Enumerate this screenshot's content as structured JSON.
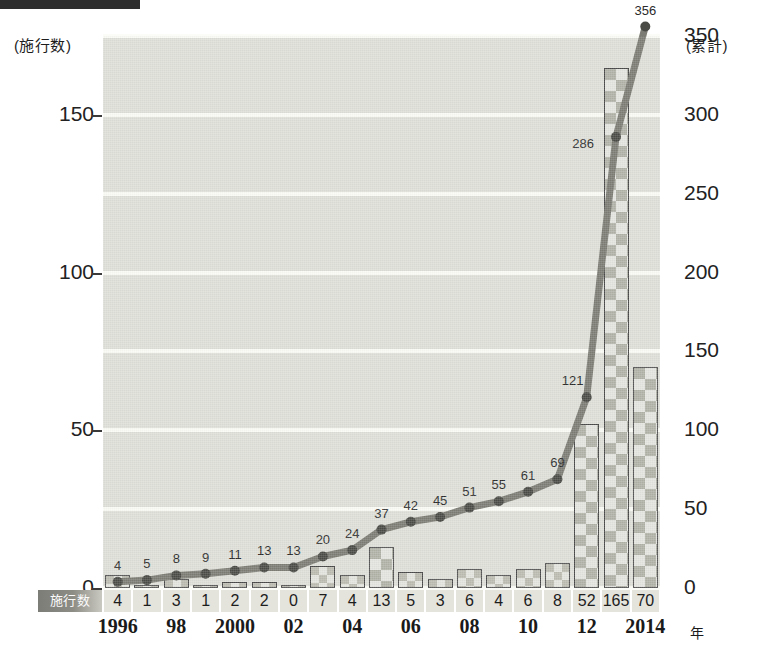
{
  "axis": {
    "left_caption": "(施行数)",
    "right_caption": "(累計)",
    "left_ticks": [
      "0",
      "50",
      "100",
      "150"
    ],
    "right_ticks": [
      "0",
      "50",
      "100",
      "150",
      "200",
      "250",
      "300",
      "350"
    ],
    "x_unit": "年",
    "row_label": "施行数"
  },
  "chart_data": {
    "type": "bar",
    "title": "",
    "subtitle": "",
    "xlabel": "年",
    "ylabel": "施行数",
    "grid": true,
    "legend_position": "none",
    "categories": [
      "1996",
      "1997",
      "1998",
      "1999",
      "2000",
      "2001",
      "2002",
      "2003",
      "2004",
      "2005",
      "2006",
      "2007",
      "2008",
      "2009",
      "2010",
      "2011",
      "2012",
      "2013",
      "2014"
    ],
    "tick_labels": [
      "1996",
      "",
      "98",
      "",
      "2000",
      "",
      "02",
      "",
      "04",
      "",
      "06",
      "",
      "08",
      "",
      "10",
      "",
      "12",
      "",
      "2014"
    ],
    "series": [
      {
        "name": "施行数",
        "type": "bar",
        "axis": "left",
        "values": [
          4,
          1,
          3,
          1,
          2,
          2,
          0,
          7,
          4,
          13,
          5,
          3,
          6,
          4,
          6,
          8,
          52,
          165,
          70
        ],
        "ylim": [
          0,
          175
        ],
        "yticks": [
          0,
          50,
          100,
          150
        ]
      },
      {
        "name": "累計",
        "type": "line",
        "axis": "right",
        "values": [
          4,
          5,
          8,
          9,
          11,
          13,
          13,
          20,
          24,
          37,
          42,
          45,
          51,
          55,
          61,
          69,
          121,
          286,
          356
        ],
        "labels": [
          "4",
          "5",
          "8",
          "9",
          "11",
          "13",
          "13",
          "20",
          "24",
          "37",
          "42",
          "45",
          "51",
          "55",
          "61",
          "69",
          "121",
          "286",
          "356"
        ],
        "ylim": [
          0,
          350
        ],
        "yticks": [
          0,
          50,
          100,
          150,
          200,
          250,
          300,
          350
        ]
      }
    ]
  },
  "colors": {
    "plot_background": "#dedfd7",
    "gridline": "#fbfbf7",
    "line": "#7c7c74",
    "marker": "#4a4a46",
    "bar_border": "#4a4a4a",
    "bar_fill": "#c2c3b8",
    "text": "#1d1d1d",
    "strip_cell": "#e4e4dd",
    "strip_label": "#8d8d86",
    "topbar": "#2e2e2e"
  }
}
